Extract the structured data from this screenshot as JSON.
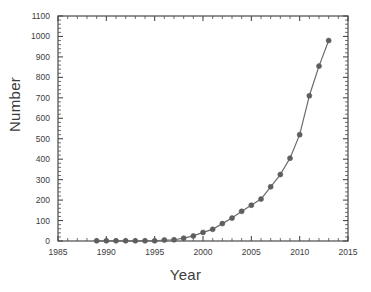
{
  "chart_data": {
    "type": "line",
    "title": "",
    "xlabel": "Year",
    "ylabel": "Number",
    "xlim": [
      1985,
      2015
    ],
    "ylim": [
      0,
      1100
    ],
    "xticks": [
      1985,
      1990,
      1995,
      2000,
      2005,
      2010,
      2015
    ],
    "xtick_labels": [
      "1985",
      "1990",
      "1995",
      "2000",
      "2005",
      "2010",
      "2015"
    ],
    "yticks": [
      0,
      100,
      200,
      300,
      400,
      500,
      600,
      700,
      800,
      900,
      1000,
      1100
    ],
    "ytick_labels": [
      "0",
      "100",
      "200",
      "300",
      "400",
      "500",
      "600",
      "700",
      "800",
      "900",
      "1000",
      "1100"
    ],
    "x_minor_tick_interval": 1,
    "y_minor_tick_interval": 20,
    "grid": false,
    "legend": null,
    "marker": "filled-circle",
    "line_color": "#6b6b6b",
    "marker_color": "#5e5e5e",
    "axis_color": "#4a4a4a",
    "background_color": "#ffffff",
    "x": [
      1989,
      1990,
      1991,
      1992,
      1993,
      1994,
      1995,
      1996,
      1997,
      1998,
      1999,
      2000,
      2001,
      2002,
      2003,
      2004,
      2005,
      2006,
      2007,
      2008,
      2009,
      2010,
      2011,
      2012,
      2013
    ],
    "values": [
      1,
      1,
      1,
      1,
      1,
      1,
      1,
      5,
      6,
      14,
      25,
      42,
      57,
      85,
      112,
      145,
      175,
      205,
      265,
      325,
      405,
      520,
      710,
      855,
      980
    ],
    "series": [
      {
        "name": "Number",
        "x": [
          1989,
          1990,
          1991,
          1992,
          1993,
          1994,
          1995,
          1996,
          1997,
          1998,
          1999,
          2000,
          2001,
          2002,
          2003,
          2004,
          2005,
          2006,
          2007,
          2008,
          2009,
          2010,
          2011,
          2012,
          2013
        ],
        "values": [
          1,
          1,
          1,
          1,
          1,
          1,
          1,
          5,
          6,
          14,
          25,
          42,
          57,
          85,
          112,
          145,
          175,
          205,
          265,
          325,
          405,
          520,
          710,
          855,
          980
        ]
      }
    ]
  }
}
